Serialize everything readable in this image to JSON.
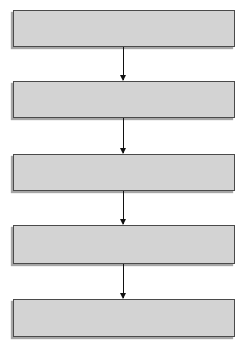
{
  "diagram": {
    "type": "vertical-flowchart",
    "colors": {
      "box_fill": "#d3d3d3",
      "box_border": "#4a4a4a",
      "arrow": "#111111",
      "background": "#ffffff"
    },
    "boxes": [
      {
        "label": ""
      },
      {
        "label": ""
      },
      {
        "label": ""
      },
      {
        "label": ""
      },
      {
        "label": ""
      }
    ],
    "arrows": [
      {
        "from": 0,
        "to": 1
      },
      {
        "from": 1,
        "to": 2
      },
      {
        "from": 2,
        "to": 3
      },
      {
        "from": 3,
        "to": 4
      }
    ]
  }
}
